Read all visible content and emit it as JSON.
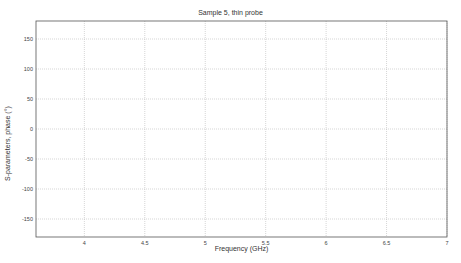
{
  "chart_data": {
    "type": "line",
    "title": "Sample 5,  thin probe",
    "xlabel": "Frequency (GHz)",
    "ylabel": "S-parameters,  phase (°)",
    "xlim": [
      3.6,
      7
    ],
    "ylim": [
      -180,
      180
    ],
    "xticks": [
      "4",
      "4.5",
      "5",
      "5.5",
      "6",
      "6.5",
      "7"
    ],
    "yticks": [
      "150",
      "100",
      "50",
      "0",
      "-50",
      "-100",
      "-150"
    ],
    "grid": true,
    "legend_position": "upper-right",
    "legend": [
      "S11",
      "S21",
      "S12",
      "S22"
    ],
    "series": [
      {
        "name": "S11",
        "color": "#333333",
        "segments": [
          [
            [
              3.72,
              130
            ],
            [
              3.8,
              105
            ],
            [
              3.9,
              75
            ],
            [
              4.0,
              40
            ],
            [
              4.05,
              10
            ],
            [
              4.1,
              -30
            ],
            [
              4.15,
              -80
            ],
            [
              4.2,
              -130
            ],
            [
              4.22,
              -180
            ]
          ],
          [
            [
              4.22,
              180
            ],
            [
              4.3,
              80
            ],
            [
              4.33,
              40
            ],
            [
              4.4,
              -40
            ],
            [
              4.5,
              -110
            ],
            [
              4.6,
              -155
            ],
            [
              4.8,
              -180
            ]
          ],
          [
            [
              4.8,
              180
            ],
            [
              5.0,
              70
            ],
            [
              5.2,
              -60
            ],
            [
              5.35,
              -180
            ]
          ],
          [
            [
              5.35,
              180
            ],
            [
              5.5,
              90
            ],
            [
              5.7,
              -50
            ],
            [
              5.96,
              -180
            ]
          ],
          [
            [
              5.96,
              180
            ],
            [
              6.2,
              50
            ],
            [
              6.5,
              -40
            ],
            [
              6.7,
              -150
            ],
            [
              6.8,
              -180
            ]
          ],
          [
            [
              6.8,
              180
            ],
            [
              6.9,
              30
            ],
            [
              7.0,
              -140
            ]
          ]
        ]
      },
      {
        "name": "S21",
        "color": "#888888",
        "segments": [
          [
            [
              3.72,
              52
            ],
            [
              3.8,
              42
            ],
            [
              3.9,
              25
            ],
            [
              4.0,
              5
            ],
            [
              4.1,
              -30
            ],
            [
              4.2,
              -80
            ],
            [
              4.3,
              -150
            ],
            [
              4.33,
              -180
            ]
          ],
          [
            [
              4.33,
              180
            ],
            [
              4.4,
              100
            ],
            [
              4.6,
              30
            ],
            [
              4.8,
              -20
            ],
            [
              5.0,
              -80
            ],
            [
              5.2,
              -140
            ],
            [
              5.32,
              -180
            ]
          ],
          [
            [
              5.32,
              180
            ],
            [
              5.5,
              90
            ],
            [
              5.7,
              -40
            ],
            [
              5.96,
              -180
            ]
          ],
          [
            [
              5.96,
              180
            ],
            [
              6.2,
              50
            ],
            [
              6.5,
              -40
            ],
            [
              6.7,
              -150
            ],
            [
              6.8,
              -180
            ]
          ]
        ]
      },
      {
        "name": "S12",
        "color": "#444444",
        "segments": [
          [
            [
              3.72,
              52
            ],
            [
              3.8,
              43
            ],
            [
              3.9,
              26
            ],
            [
              4.0,
              6
            ],
            [
              4.1,
              -25
            ],
            [
              4.2,
              -70
            ],
            [
              4.3,
              -145
            ],
            [
              4.34,
              -180
            ]
          ],
          [
            [
              4.34,
              180
            ],
            [
              4.4,
              110
            ],
            [
              4.6,
              40
            ],
            [
              4.8,
              -10
            ],
            [
              5.0,
              -70
            ],
            [
              5.2,
              -130
            ],
            [
              5.34,
              -180
            ]
          ],
          [
            [
              5.34,
              180
            ],
            [
              5.5,
              92
            ],
            [
              5.7,
              -45
            ],
            [
              5.97,
              -180
            ]
          ],
          [
            [
              5.97,
              180
            ],
            [
              6.2,
              55
            ],
            [
              6.5,
              -38
            ],
            [
              6.7,
              -148
            ],
            [
              6.8,
              -180
            ]
          ]
        ]
      },
      {
        "name": "S22",
        "color": "#aaaaaa",
        "segments": [
          [
            [
              3.72,
              128
            ],
            [
              3.8,
              103
            ],
            [
              3.9,
              73
            ],
            [
              4.0,
              38
            ],
            [
              4.1,
              -32
            ],
            [
              4.2,
              -132
            ],
            [
              4.22,
              -180
            ]
          ],
          [
            [
              4.22,
              180
            ],
            [
              4.3,
              78
            ],
            [
              4.4,
              -42
            ],
            [
              4.6,
              -157
            ],
            [
              4.8,
              -180
            ]
          ],
          [
            [
              4.8,
              180
            ],
            [
              5.0,
              68
            ],
            [
              5.2,
              -62
            ],
            [
              5.35,
              -180
            ]
          ],
          [
            [
              6.8,
              180
            ],
            [
              6.9,
              28
            ],
            [
              7.0,
              -142
            ]
          ]
        ]
      }
    ]
  },
  "title": "Sample 5,  thin probe",
  "xlabel": "Frequency (GHz)",
  "ylabel": "S-parameters,  phase (°)",
  "legend": {
    "items": [
      {
        "label": "S",
        "sub": "11",
        "color": "#333333"
      },
      {
        "label": "S",
        "sub": "21",
        "color": "#888888"
      },
      {
        "label": "S",
        "sub": "12",
        "color": "#444444"
      },
      {
        "label": "S",
        "sub": "22",
        "color": "#aaaaaa"
      }
    ]
  }
}
